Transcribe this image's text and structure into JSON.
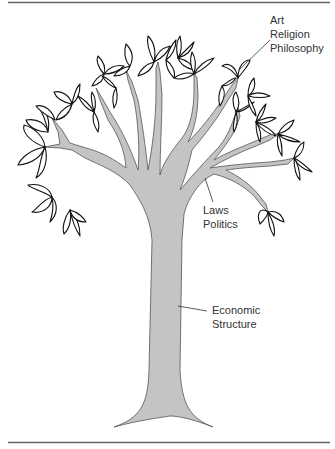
{
  "diagram": {
    "labels": {
      "superstructure_top": [
        "Art",
        "Religion",
        "Philosophy"
      ],
      "superstructure_mid": [
        "Laws",
        "Politics"
      ],
      "base": [
        "Economic",
        "Structure"
      ]
    },
    "colors": {
      "trunk_fill": "#c4c4c4",
      "trunk_stroke": "#555555",
      "leaf_stroke": "#111111",
      "rule": "#555555",
      "text": "#333333"
    }
  }
}
